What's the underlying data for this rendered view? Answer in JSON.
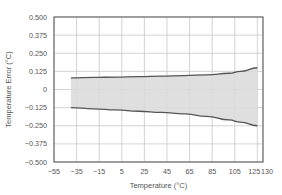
{
  "chart_data": {
    "type": "area",
    "title": "",
    "xlabel": "Temperature (°C)",
    "ylabel": "Temperature Error (°C)",
    "xlim": [
      -55,
      130
    ],
    "ylim": [
      -0.5,
      0.5
    ],
    "grid": true,
    "legend": null,
    "x_ticks": [
      -55,
      -35,
      -15,
      5,
      25,
      45,
      65,
      85,
      105,
      125,
      130
    ],
    "x_tick_labels": [
      "−55",
      "−35",
      "−15",
      "5",
      "25",
      "45",
      "65",
      "85",
      "105",
      "125",
      "130"
    ],
    "y_ticks": [
      0.5,
      0.375,
      0.25,
      0.125,
      0,
      -0.125,
      -0.25,
      -0.375,
      -0.5
    ],
    "y_tick_labels": [
      "0.500",
      "0.375",
      "0.250",
      "0.125",
      "0",
      "−0.125",
      "−0.250",
      "−0.375",
      "−0.500"
    ],
    "x": [
      -40,
      -20,
      0,
      20,
      40,
      60,
      80,
      100,
      110,
      125
    ],
    "series": [
      {
        "name": "Upper limit",
        "values": [
          0.08,
          0.083,
          0.086,
          0.089,
          0.092,
          0.096,
          0.101,
          0.112,
          0.125,
          0.15
        ]
      },
      {
        "name": "Lower limit",
        "values": [
          -0.125,
          -0.133,
          -0.141,
          -0.15,
          -0.158,
          -0.168,
          -0.185,
          -0.21,
          -0.225,
          -0.25
        ]
      }
    ],
    "fill_between": true,
    "colors": {
      "fill": "#dcdcdc",
      "line": "#555555",
      "grid": "#c8c8c8",
      "frame": "#555555"
    }
  }
}
